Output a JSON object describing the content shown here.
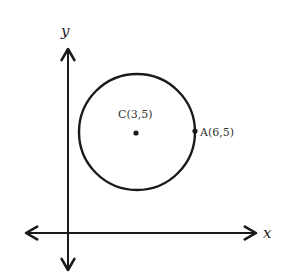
{
  "diagram": {
    "type": "coordinate-plane-circle",
    "axes": {
      "x_label": "x",
      "y_label": "y"
    },
    "circle": {
      "center_label": "C(3,5)",
      "center": [
        3,
        5
      ],
      "point_on_circle_label": "A(6,5)",
      "point_on_circle": [
        6,
        5
      ],
      "radius": 3
    },
    "colors": {
      "stroke": "#1a1a1a",
      "background": "#ffffff"
    }
  }
}
